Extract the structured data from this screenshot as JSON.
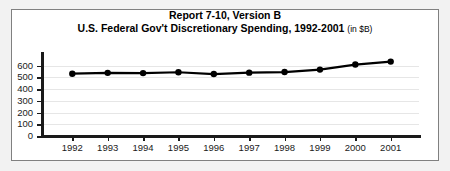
{
  "chart_data": {
    "type": "line",
    "title": "Report 7-10, Version B",
    "subtitle": "U.S. Federal Gov't Discretionary Spending, 1992-2001",
    "subtitle_suffix": "(in $B)",
    "xlabel": "",
    "ylabel": "",
    "categories": [
      "1992",
      "1993",
      "1994",
      "1995",
      "1996",
      "1997",
      "1998",
      "1999",
      "2000",
      "2001"
    ],
    "values": [
      532,
      539,
      537,
      544,
      529,
      541,
      546,
      567,
      610,
      635
    ],
    "ylim": [
      0,
      700
    ],
    "yticks": [
      0,
      100,
      200,
      300,
      400,
      500,
      600
    ],
    "ytick_labels": [
      "0",
      "100",
      "200",
      "300",
      "400",
      "500",
      "600"
    ],
    "grid": true,
    "grid_axis": "y",
    "legend": false,
    "series": [
      {
        "name": "Discretionary Spending",
        "values": [
          532,
          539,
          537,
          544,
          529,
          541,
          546,
          567,
          610,
          635
        ]
      }
    ],
    "colors": {
      "line": "#000000",
      "marker": "#000000",
      "grid": "#e6e6e6",
      "axis": "#1a1a1a",
      "plot_background": "#ffffff",
      "figure_background": "#f2f2f2",
      "frame_border": "#808080"
    },
    "marker": "circle"
  }
}
